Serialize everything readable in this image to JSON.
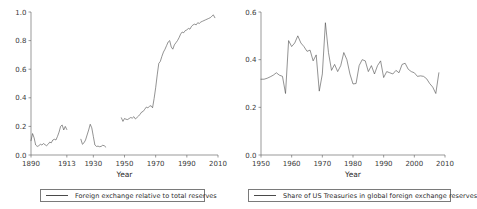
{
  "figure": {
    "background": "#ffffff",
    "line_color": "#4a4a4a",
    "axis_color": "#6f6f6f",
    "text_color": "#2b2b2b"
  },
  "panels": [
    {
      "id": "left",
      "legend_label": "Foreign exchange relative to total reserves",
      "xlabel": "Year"
    },
    {
      "id": "right",
      "legend_label": "Share of US Treasuries in global foreign exchange reserves",
      "xlabel": "Year"
    }
  ],
  "chart_data": [
    {
      "type": "line",
      "id": "foreign-exchange-share",
      "title": "",
      "xlabel": "Year",
      "ylabel": "",
      "xlim": [
        1890,
        2010
      ],
      "ylim": [
        0.0,
        1.0
      ],
      "xticks": [
        1890,
        1913,
        1930,
        1950,
        1970,
        1990,
        2010
      ],
      "xticklabels": [
        "1890",
        "1913",
        "1930",
        "1950",
        "1970",
        "1990",
        "2010"
      ],
      "yticks": [
        0.0,
        0.2,
        0.4,
        0.6,
        0.8,
        1.0
      ],
      "yticklabels": [
        "0.0",
        "0.2",
        "0.4",
        "0.6",
        "0.8",
        "1.0"
      ],
      "grid": false,
      "legend_position": "below",
      "series": [
        {
          "name": "Foreign exchange relative to total reserves",
          "segments": [
            {
              "x": [
                1890,
                1891,
                1892,
                1893,
                1894,
                1895,
                1896,
                1897,
                1898,
                1899,
                1900,
                1901,
                1902,
                1903,
                1904,
                1905,
                1906,
                1907,
                1908,
                1909,
                1910,
                1911,
                1912,
                1913
              ],
              "y": [
                0.1,
                0.15,
                0.12,
                0.07,
                0.06,
                0.065,
                0.075,
                0.07,
                0.08,
                0.072,
                0.065,
                0.075,
                0.09,
                0.085,
                0.105,
                0.11,
                0.105,
                0.13,
                0.16,
                0.2,
                0.21,
                0.175,
                0.2,
                0.178
              ]
            },
            {
              "x": [
                1922,
                1923,
                1924,
                1925,
                1926,
                1927,
                1928,
                1929,
                1930,
                1931,
                1932,
                1933,
                1934,
                1935,
                1936,
                1937,
                1938
              ],
              "y": [
                0.11,
                0.075,
                0.085,
                0.105,
                0.14,
                0.175,
                0.215,
                0.19,
                0.13,
                0.07,
                0.06,
                0.062,
                0.058,
                0.06,
                0.068,
                0.065,
                0.055
              ]
            },
            {
              "x": [
                1948,
                1949,
                1950,
                1951,
                1952,
                1953,
                1954,
                1955,
                1956,
                1957,
                1958,
                1959,
                1960,
                1961,
                1962,
                1963,
                1964,
                1965,
                1966,
                1967,
                1968,
                1969,
                1970,
                1971,
                1972,
                1973,
                1974,
                1975,
                1976,
                1977,
                1978,
                1979,
                1980,
                1981,
                1982,
                1983,
                1984,
                1985,
                1986,
                1987,
                1988,
                1989,
                1990,
                1991,
                1992,
                1993,
                1994,
                1995,
                1996,
                1997,
                1998,
                1999,
                2000,
                2001,
                2002,
                2003,
                2004,
                2005,
                2006,
                2007,
                2008
              ],
              "y": [
                0.26,
                0.235,
                0.255,
                0.25,
                0.248,
                0.255,
                0.262,
                0.258,
                0.268,
                0.252,
                0.262,
                0.272,
                0.285,
                0.3,
                0.305,
                0.32,
                0.335,
                0.33,
                0.34,
                0.345,
                0.33,
                0.395,
                0.47,
                0.56,
                0.64,
                0.655,
                0.69,
                0.72,
                0.74,
                0.765,
                0.79,
                0.8,
                0.755,
                0.74,
                0.77,
                0.785,
                0.8,
                0.82,
                0.845,
                0.86,
                0.855,
                0.87,
                0.875,
                0.885,
                0.88,
                0.9,
                0.91,
                0.915,
                0.91,
                0.925,
                0.92,
                0.93,
                0.935,
                0.94,
                0.945,
                0.95,
                0.955,
                0.96,
                0.97,
                0.98,
                0.96
              ]
            }
          ]
        }
      ]
    },
    {
      "type": "line",
      "id": "us-treasuries-share",
      "title": "",
      "xlabel": "Year",
      "ylabel": "",
      "xlim": [
        1950,
        2010
      ],
      "ylim": [
        0.0,
        0.6
      ],
      "xticks": [
        1950,
        1960,
        1970,
        1980,
        1990,
        2000,
        2010
      ],
      "xticklabels": [
        "1950",
        "1960",
        "1970",
        "1980",
        "1990",
        "2000",
        "2010"
      ],
      "yticks": [
        0.0,
        0.2,
        0.4,
        0.6
      ],
      "yticklabels": [
        "0.0",
        "0.2",
        "0.4",
        "0.6"
      ],
      "grid": false,
      "legend_position": "below",
      "series": [
        {
          "name": "Share of US Treasuries in global foreign exchange reserves",
          "segments": [
            {
              "x": [
                1950,
                1951,
                1952,
                1953,
                1954,
                1955,
                1956,
                1957,
                1958,
                1959,
                1960,
                1961,
                1962,
                1963,
                1964,
                1965,
                1966,
                1967,
                1968,
                1969,
                1970,
                1971,
                1972,
                1973,
                1974,
                1975,
                1976,
                1977,
                1978,
                1979,
                1980,
                1981,
                1982,
                1983,
                1984,
                1985,
                1986,
                1987,
                1988,
                1989,
                1990,
                1991,
                1992,
                1993,
                1994,
                1995,
                1996,
                1997,
                1998,
                1999,
                2000,
                2001,
                2002,
                2003,
                2004,
                2005,
                2006,
                2007,
                2008
              ],
              "y": [
                0.318,
                0.318,
                0.322,
                0.328,
                0.335,
                0.345,
                0.335,
                0.33,
                0.258,
                0.48,
                0.455,
                0.47,
                0.5,
                0.47,
                0.455,
                0.435,
                0.44,
                0.395,
                0.42,
                0.268,
                0.34,
                0.555,
                0.43,
                0.355,
                0.38,
                0.35,
                0.375,
                0.43,
                0.4,
                0.34,
                0.298,
                0.3,
                0.375,
                0.4,
                0.395,
                0.35,
                0.375,
                0.34,
                0.375,
                0.395,
                0.325,
                0.35,
                0.345,
                0.34,
                0.355,
                0.345,
                0.38,
                0.385,
                0.36,
                0.35,
                0.345,
                0.33,
                0.332,
                0.33,
                0.32,
                0.3,
                0.285,
                0.258,
                0.345
              ]
            }
          ]
        }
      ]
    }
  ]
}
